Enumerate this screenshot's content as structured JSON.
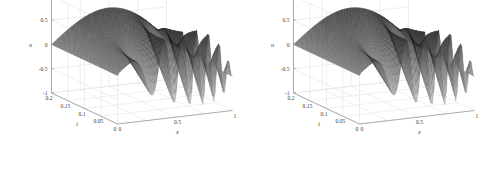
{
  "figure": {
    "title": "",
    "background_color": "#ffffff",
    "panel_count": 2
  },
  "panels": [
    {
      "id": "left-plot",
      "name": "surface-plot-left",
      "axes": {
        "x": {
          "label": "x",
          "ticks": [
            "0",
            "0.5",
            "1"
          ],
          "range": [
            0,
            1
          ]
        },
        "t": {
          "label": "t",
          "ticks": [
            "0.2",
            "0.15",
            "0.1",
            "0.05",
            "0"
          ],
          "range": [
            0,
            0.2
          ]
        },
        "u": {
          "label": "u",
          "ticks": [
            "1",
            "0.5",
            "0",
            "-0.5",
            "-1"
          ],
          "range": [
            -1,
            1
          ]
        }
      }
    },
    {
      "id": "right-plot",
      "name": "surface-plot-right",
      "axes": {
        "x": {
          "label": "x",
          "ticks": [
            "0",
            "0.5",
            "1"
          ],
          "range": [
            0,
            1
          ]
        },
        "t": {
          "label": "t",
          "ticks": [
            "0.2",
            "0.15",
            "0.1",
            "0.05",
            "0"
          ],
          "range": [
            0,
            0.2
          ]
        },
        "u": {
          "label": "u",
          "ticks": [
            "1",
            "0.5",
            "0",
            "-0.5",
            "-1"
          ],
          "range": [
            -1,
            1
          ]
        }
      }
    }
  ],
  "chart_data": [
    {
      "type": "surface",
      "title": "",
      "xlabel": "x",
      "ylabel": "t",
      "zlabel": "u",
      "xlim": [
        0,
        1
      ],
      "ylim": [
        0,
        0.2
      ],
      "zlim": [
        -1,
        1
      ],
      "xticks": [
        0,
        0.5,
        1
      ],
      "yticks": [
        0,
        0.05,
        0.1,
        0.15,
        0.2
      ],
      "zticks": [
        -1,
        -0.5,
        0,
        0.5,
        1
      ],
      "grid": true,
      "colormap": "gray",
      "mesh": true,
      "view_azimuth": -37.5,
      "view_elevation": 30,
      "description": "Mesh surface of u(x,t) showing a smooth initial profile at t=0.2 (back) that steepens and develops oscillatory wave structure toward t=0 (front); amplitude spans about -1 to 0.75.",
      "x": [
        0,
        0.1,
        0.2,
        0.3,
        0.4,
        0.5,
        0.6,
        0.7,
        0.8,
        0.9,
        1.0
      ],
      "t": [
        0,
        0.05,
        0.1,
        0.15,
        0.2
      ],
      "z": [
        [
          0.0,
          0.55,
          0.72,
          0.4,
          -0.45,
          -0.95,
          -0.3,
          0.45,
          0.2,
          -0.55,
          -0.25
        ],
        [
          0.0,
          0.5,
          0.7,
          0.45,
          -0.3,
          -0.8,
          -0.25,
          0.4,
          0.22,
          -0.45,
          -0.25
        ],
        [
          0.0,
          0.45,
          0.66,
          0.5,
          -0.15,
          -0.6,
          -0.18,
          0.35,
          0.25,
          -0.32,
          -0.25
        ],
        [
          0.0,
          0.38,
          0.6,
          0.55,
          0.05,
          -0.38,
          -0.08,
          0.3,
          0.28,
          -0.18,
          -0.25
        ],
        [
          0.0,
          0.3,
          0.55,
          0.6,
          0.3,
          -0.1,
          0.05,
          0.28,
          0.3,
          -0.05,
          -0.25
        ]
      ]
    },
    {
      "type": "surface",
      "title": "",
      "xlabel": "x",
      "ylabel": "t",
      "zlabel": "u",
      "xlim": [
        0,
        1
      ],
      "ylim": [
        0,
        0.2
      ],
      "zlim": [
        -1,
        1
      ],
      "xticks": [
        0,
        0.5,
        1
      ],
      "yticks": [
        0,
        0.05,
        0.1,
        0.15,
        0.2
      ],
      "zticks": [
        -1,
        -0.5,
        0,
        0.5,
        1
      ],
      "grid": true,
      "colormap": "gray",
      "mesh": true,
      "view_azimuth": -37.5,
      "view_elevation": 30,
      "description": "Second mesh surface of u(x,t), visually near-identical to the left panel; same steepening wave profile with oscillations near x = 0.5 to 1.",
      "x": [
        0,
        0.1,
        0.2,
        0.3,
        0.4,
        0.5,
        0.6,
        0.7,
        0.8,
        0.9,
        1.0
      ],
      "t": [
        0,
        0.05,
        0.1,
        0.15,
        0.2
      ],
      "z": [
        [
          0.0,
          0.55,
          0.72,
          0.4,
          -0.45,
          -0.95,
          -0.3,
          0.45,
          0.2,
          -0.55,
          -0.25
        ],
        [
          0.0,
          0.5,
          0.7,
          0.45,
          -0.3,
          -0.8,
          -0.25,
          0.4,
          0.22,
          -0.45,
          -0.25
        ],
        [
          0.0,
          0.45,
          0.66,
          0.5,
          -0.15,
          -0.6,
          -0.18,
          0.35,
          0.25,
          -0.32,
          -0.25
        ],
        [
          0.0,
          0.38,
          0.6,
          0.55,
          0.05,
          -0.38,
          -0.08,
          0.3,
          0.28,
          -0.18,
          -0.25
        ],
        [
          0.0,
          0.3,
          0.55,
          0.6,
          0.3,
          -0.1,
          0.05,
          0.28,
          0.3,
          -0.05,
          -0.25
        ]
      ]
    }
  ]
}
